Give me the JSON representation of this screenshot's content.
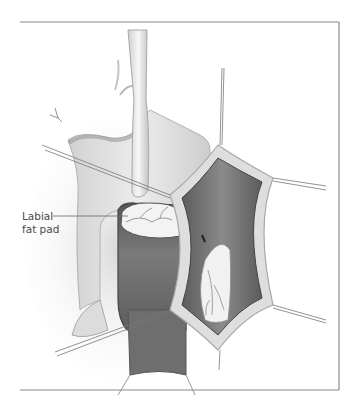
{
  "figure": {
    "type": "surgical anatomical illustration",
    "style": "grayscale",
    "colors": {
      "background": "#ffffff",
      "frame": "#8a8a8a",
      "tissue_light": "#e6e6e6",
      "tissue_mid": "#cfcfcf",
      "cavity_dark": "#6e6e6e",
      "vessels": "#9a9a9a",
      "fat_pad": "#f2f2f2"
    }
  },
  "annotations": [
    {
      "label_line1": "Labial",
      "label_line2": "fat pad",
      "target": "labial fat pad"
    }
  ]
}
